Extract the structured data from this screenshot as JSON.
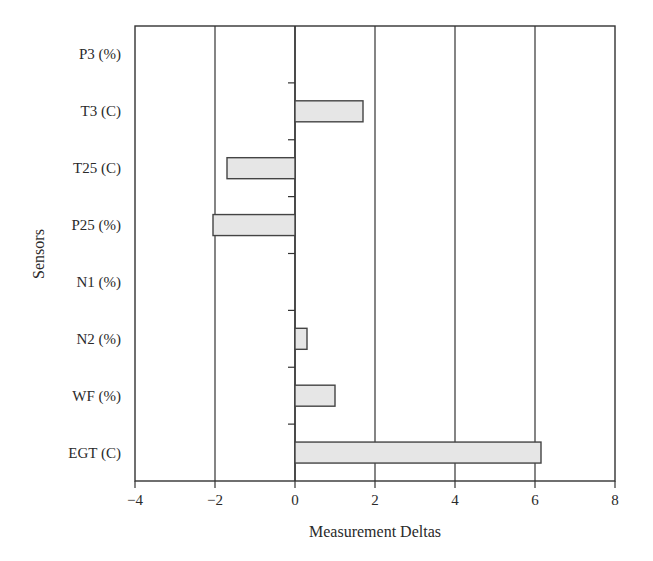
{
  "chart_data": {
    "type": "bar",
    "orientation": "horizontal",
    "title": "",
    "xlabel": "Measurement Deltas",
    "ylabel": "Sensors",
    "categories": [
      "P3 (%)",
      "T3 (C)",
      "T25 (C)",
      "P25 (%)",
      "N1 (%)",
      "N2 (%)",
      "WF (%)",
      "EGT (C)"
    ],
    "values": [
      0,
      1.7,
      -1.7,
      -2.05,
      0,
      0.3,
      1.0,
      6.15
    ],
    "xlim": [
      -4,
      8
    ],
    "xticks": [
      -4,
      -2,
      0,
      2,
      4,
      6,
      8
    ],
    "xtick_labels": [
      "−4",
      "−2",
      "0",
      "2",
      "4",
      "6",
      "8"
    ],
    "grid": "vertical lines at each x tick",
    "legend": null,
    "bar_fill": "#e6e6e6",
    "bar_edge": "#444444"
  }
}
